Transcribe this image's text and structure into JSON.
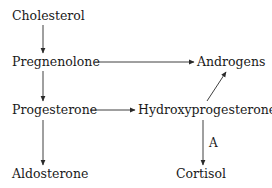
{
  "diagram": {
    "type": "flowchart",
    "title": "",
    "nodes": [
      {
        "id": "cholesterol",
        "label": "Cholesterol"
      },
      {
        "id": "pregnenolone",
        "label": "Pregnenolone"
      },
      {
        "id": "androgens",
        "label": "Androgens"
      },
      {
        "id": "progesterone",
        "label": "Progesterone"
      },
      {
        "id": "hydroxyprogesterone",
        "label": "Hydroxyprogesterone"
      },
      {
        "id": "aldosterone",
        "label": "Aldosterone"
      },
      {
        "id": "cortisol",
        "label": "Cortisol"
      }
    ],
    "edges": [
      {
        "from": "cholesterol",
        "to": "pregnenolone",
        "label": ""
      },
      {
        "from": "pregnenolone",
        "to": "androgens",
        "label": ""
      },
      {
        "from": "pregnenolone",
        "to": "progesterone",
        "label": ""
      },
      {
        "from": "progesterone",
        "to": "hydroxyprogesterone",
        "label": ""
      },
      {
        "from": "hydroxyprogesterone",
        "to": "androgens",
        "label": ""
      },
      {
        "from": "progesterone",
        "to": "aldosterone",
        "label": ""
      },
      {
        "from": "hydroxyprogesterone",
        "to": "cortisol",
        "label": "A"
      }
    ],
    "colors": {
      "text": "#1a1a1a",
      "arrow": "#2a2a2a",
      "background": "#ffffff"
    }
  }
}
